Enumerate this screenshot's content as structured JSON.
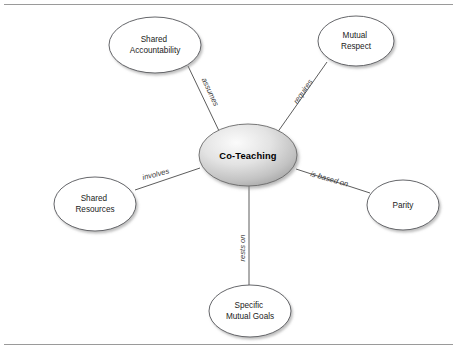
{
  "diagram": {
    "center": {
      "label": "Co-Teaching",
      "cx": 248,
      "cy": 155,
      "rx": 49,
      "ry": 31
    },
    "colors": {
      "node_stroke": "#55565a",
      "node_fill": "#ffffff",
      "edge_stroke": "#4a4a4a",
      "center_gradient_light": "#f2f2f2",
      "center_gradient_dark": "#a8a8a8",
      "text": "#1b1b1b",
      "edge_label_text": "#3c3c3c",
      "frame_rule": "#9a9a9a",
      "background": "#ffffff"
    },
    "nodes": [
      {
        "id": "shared-accountability",
        "lines": [
          "Shared",
          "Accountability"
        ],
        "cx": 155,
        "cy": 45,
        "rx": 46,
        "ry": 28
      },
      {
        "id": "mutual-respect",
        "lines": [
          "Mutual",
          "Respect"
        ],
        "cx": 356,
        "cy": 41,
        "rx": 38,
        "ry": 25
      },
      {
        "id": "parity",
        "lines": [
          "Parity"
        ],
        "cx": 403,
        "cy": 205,
        "rx": 36,
        "ry": 25
      },
      {
        "id": "specific-mutual-goals",
        "lines": [
          "Specific",
          "Mutual Goals"
        ],
        "cx": 250,
        "cy": 311,
        "rx": 41,
        "ry": 26
      },
      {
        "id": "shared-resources",
        "lines": [
          "Shared",
          "Resources"
        ],
        "cx": 95,
        "cy": 204,
        "rx": 41,
        "ry": 27
      }
    ],
    "edges": [
      {
        "id": "edge-assumes",
        "label": "assumes",
        "from": "co-teaching",
        "to": "shared-accountability",
        "x1": 220,
        "y1": 133,
        "x2": 188,
        "y2": 66,
        "label_x": 208,
        "label_y": 93,
        "label_rotate": 65
      },
      {
        "id": "edge-requires",
        "label": "requires",
        "from": "co-teaching",
        "to": "mutual-respect",
        "x1": 277,
        "y1": 133,
        "x2": 327,
        "y2": 62,
        "label_x": 305,
        "label_y": 93,
        "label_rotate": -55
      },
      {
        "id": "edge-is-based-on",
        "label": "is based on",
        "from": "co-teaching",
        "to": "parity",
        "x1": 296,
        "y1": 169,
        "x2": 370,
        "y2": 193,
        "label_x": 310,
        "label_y": 176,
        "label_rotate": 16
      },
      {
        "id": "edge-rests-on",
        "label": "rests on",
        "from": "co-teaching",
        "to": "specific-mutual-goals",
        "x1": 249,
        "y1": 186,
        "x2": 249,
        "y2": 285,
        "label_x": 245,
        "label_y": 248,
        "label_rotate": -90
      },
      {
        "id": "edge-involves",
        "label": "involves",
        "from": "co-teaching",
        "to": "shared-resources",
        "x1": 200,
        "y1": 168,
        "x2": 135,
        "y2": 190,
        "label_x": 143,
        "label_y": 180,
        "label_rotate": -14
      }
    ],
    "frame": {
      "top_rule_y": 4,
      "bottom_rule_y": 344,
      "left_x": 4,
      "right_x": 453
    }
  }
}
